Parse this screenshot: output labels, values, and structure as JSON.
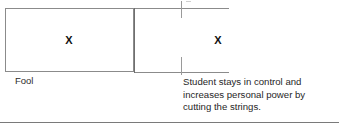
{
  "document": {
    "type": "scanned-table-fragment",
    "background_color": "#ffffff",
    "rule_color": "#8b8b8b",
    "text_color": "#1f1f1f"
  },
  "table": {
    "row": {
      "cells": [
        {
          "id": "left",
          "mark": "X",
          "caption": "Fool",
          "closed_box": true
        },
        {
          "id": "right",
          "mark": "X",
          "caption_lines": [
            "Student stays in control and",
            "increases personal power by",
            "cutting the strings."
          ],
          "closed_box": false
        }
      ]
    },
    "rules": {
      "top_line_label": "top-border",
      "bottom_line_label": "bottom-border",
      "divider_label": "column-divider",
      "tick_top_label": "column-tick-top",
      "tick_bottom_label": "column-tick-bottom",
      "footer_label": "footer-separator"
    }
  }
}
